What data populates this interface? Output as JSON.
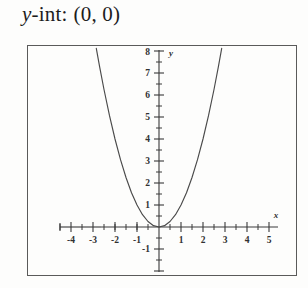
{
  "header": {
    "variable": "y",
    "label_rest": "-int:",
    "value": "(0, 0)"
  },
  "chart_data": {
    "type": "line",
    "title": "",
    "xlabel": "x",
    "ylabel": "y",
    "xlim": [
      -4.6,
      5.2
    ],
    "ylim": [
      -2.3,
      8.3
    ],
    "grid": false,
    "legend": null,
    "axis_origin": [
      0,
      0
    ],
    "x_ticks_major": [
      -4,
      -3,
      -2,
      -1,
      1,
      2,
      3,
      4,
      5
    ],
    "x_tick_labels": [
      "-4",
      "-3",
      "-2",
      "-1",
      "1",
      "2",
      "3",
      "4",
      "5"
    ],
    "x_ticks_minor": [
      -4.5,
      -3.5,
      -2.5,
      -1.5,
      -0.5,
      0.5,
      1.5,
      2.5,
      3.5,
      4.5
    ],
    "y_ticks_major": [
      1,
      2,
      3,
      4,
      5,
      6,
      7,
      8,
      -1
    ],
    "y_tick_labels": [
      "1",
      "2",
      "3",
      "4",
      "5",
      "6",
      "7",
      "8",
      "-1"
    ],
    "y_ticks_minor": [
      0.5,
      1.5,
      2.5,
      3.5,
      4.5,
      5.5,
      6.5,
      7.5,
      -0.5,
      -1.5,
      -2
    ],
    "series": [
      {
        "name": "parabola",
        "equation": "y = x^2",
        "x": [
          -2.85,
          -2.7,
          -2.5,
          -2.25,
          -2.0,
          -1.75,
          -1.5,
          -1.25,
          -1.0,
          -0.75,
          -0.5,
          -0.25,
          0,
          0.25,
          0.5,
          0.75,
          1.0,
          1.25,
          1.5,
          1.75,
          2.0,
          2.25,
          2.5,
          2.7,
          2.85
        ],
        "values": [
          8.12,
          7.29,
          6.25,
          5.06,
          4.0,
          3.06,
          2.25,
          1.56,
          1.0,
          0.56,
          0.25,
          0.06,
          0,
          0.06,
          0.25,
          0.56,
          1.0,
          1.56,
          2.25,
          3.06,
          4.0,
          5.06,
          6.25,
          7.29,
          8.12
        ]
      }
    ],
    "annotations": [
      {
        "text": "y",
        "position": "y-axis-top"
      },
      {
        "text": "x",
        "position": "x-axis-right"
      }
    ]
  }
}
